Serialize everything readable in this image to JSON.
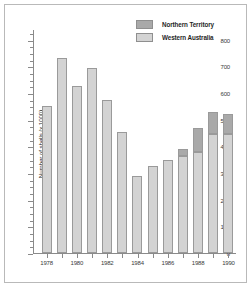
{
  "chart_data": {
    "type": "bar",
    "subtype": "stacked",
    "title": "",
    "xlabel": "",
    "ylabel": "Number of shells (x 1000)",
    "ylim": [
      0,
      800
    ],
    "ytick_step": 100,
    "ytick_minor_step": 25,
    "ytick_labels": [
      "0",
      "100",
      "200",
      "300",
      "400",
      "500",
      "600",
      "700",
      "800"
    ],
    "ytick_values": [
      0,
      100,
      200,
      300,
      400,
      500,
      600,
      700,
      800
    ],
    "grid": false,
    "legend_position": "top-right",
    "categories": [
      1978,
      1979,
      1980,
      1981,
      1982,
      1983,
      1984,
      1985,
      1986,
      1987,
      1988,
      1989,
      1990
    ],
    "xtick_labels": [
      "1978",
      "1980",
      "1982",
      "1984",
      "1986",
      "1988",
      "1990"
    ],
    "xtick_categories": [
      1978,
      1980,
      1982,
      1984,
      1986,
      1988,
      1990
    ],
    "series": [
      {
        "name": "Western Australia",
        "color": "#d3d3d3",
        "values": [
          550,
          730,
          625,
          693,
          572,
          453,
          288,
          327,
          348,
          365,
          378,
          445,
          448
        ]
      },
      {
        "name": "Northern Territory",
        "color": "#a9a9a9",
        "values": [
          0,
          0,
          0,
          0,
          0,
          0,
          0,
          0,
          0,
          25,
          90,
          83,
          75
        ]
      }
    ],
    "totals": [
      550,
      730,
      625,
      693,
      572,
      453,
      288,
      327,
      348,
      390,
      468,
      528,
      523
    ]
  },
  "legend": {
    "entries": [
      {
        "label": "Northern Territory",
        "color": "#a9a9a9"
      },
      {
        "label": "Western Australia",
        "color": "#d3d3d3"
      }
    ]
  },
  "axes": {
    "y_title": "Number of shells (x 1000)"
  }
}
